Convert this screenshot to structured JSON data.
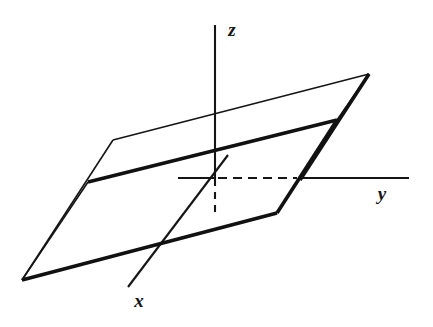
{
  "figure": {
    "background_color": "#ffffff",
    "ink_color": "#151515",
    "axes": {
      "z": {
        "label": "z",
        "label_x": 232,
        "label_y": 36,
        "font_size": 19,
        "line": {
          "x1": 215,
          "y1": 25,
          "x2": 215,
          "y2": 179
        },
        "stroke_width": 2.1,
        "direction": "vertical-up"
      },
      "y": {
        "label": "y",
        "label_x": 382,
        "label_y": 200,
        "font_size": 19,
        "stub_left": {
          "x1": 178,
          "y1": 178,
          "x2": 216,
          "y2": 178
        },
        "solid_right": {
          "x1": 298,
          "y1": 178,
          "x2": 409,
          "y2": 178
        },
        "dashed": {
          "x1": 218,
          "y1": 178,
          "x2": 297,
          "y2": 178
        },
        "dash_pattern": "9 6",
        "stroke_width": 2.1,
        "direction": "horizontal-right"
      },
      "x": {
        "label": "x",
        "label_x": 139,
        "label_y": 307,
        "font_size": 19,
        "line": {
          "x1": 228,
          "y1": 155,
          "x2": 128,
          "y2": 287
        },
        "stroke_width": 2.1,
        "direction": "toward-viewer-lower-left"
      },
      "dashed_drop": {
        "line": {
          "x1": 215,
          "y1": 179,
          "x2": 215,
          "y2": 214
        },
        "dash_pattern": "7 6",
        "stroke_width": 2.1
      }
    },
    "planes": [
      {
        "name": "upper-plane",
        "style": "thin",
        "stroke_width": 1.6,
        "notched": true,
        "vertices": [
          {
            "x": 22,
            "y": 280
          },
          {
            "x": 113,
            "y": 140
          },
          {
            "x": 125,
            "y": 140
          },
          {
            "x": 369,
            "y": 74
          },
          {
            "x": 337,
            "y": 120
          },
          {
            "x": 88,
            "y": 182
          }
        ],
        "closed": true
      },
      {
        "name": "lower-plane",
        "style": "thick",
        "stroke_width": 3.6,
        "notched": true,
        "vertices": [
          {
            "x": 88,
            "y": 182
          },
          {
            "x": 337,
            "y": 120
          },
          {
            "x": 369,
            "y": 74
          },
          {
            "x": 369,
            "y": 74
          },
          {
            "x": 277,
            "y": 213
          },
          {
            "x": 22,
            "y": 280
          }
        ],
        "closed": false
      }
    ],
    "segments": [
      {
        "name": "upper-plane-left-notch-edge",
        "style": "thin",
        "points": "22,280 113,140"
      },
      {
        "name": "upper-plane-top-edge",
        "style": "thin",
        "points": "113,140 369,74"
      },
      {
        "name": "upper-plane-right-edge",
        "style": "thin",
        "points": "369,74 337,120"
      },
      {
        "name": "upper-plane-front-edge",
        "style": "thin",
        "points": "337,120 88,182"
      },
      {
        "name": "upper-plane-near-left-edge",
        "style": "thin",
        "points": "88,182 22,280"
      },
      {
        "name": "lower-plane-back-edge",
        "style": "thick",
        "points": "88,182 337,120"
      },
      {
        "name": "lower-plane-right-edge",
        "style": "thick",
        "points": "337,120 277,213"
      },
      {
        "name": "lower-plane-front-edge",
        "style": "thick",
        "points": "277,213 22,280"
      },
      {
        "name": "lower-plane-right-riser",
        "style": "thick",
        "points": "369,74 300,180"
      }
    ],
    "labels": [
      {
        "name": "z-axis-label",
        "text": "z",
        "x": 232,
        "y": 36
      },
      {
        "name": "y-axis-label",
        "text": "y",
        "x": 382,
        "y": 200
      },
      {
        "name": "x-axis-label",
        "text": "x",
        "x": 139,
        "y": 307
      }
    ]
  }
}
